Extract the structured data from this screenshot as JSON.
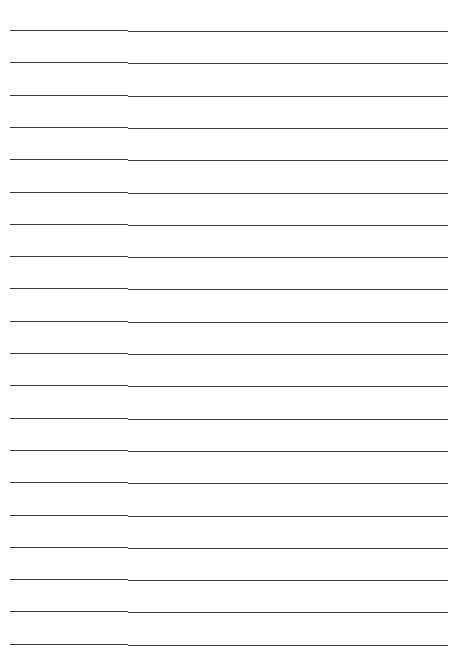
{
  "document": {
    "type": "lined-paper",
    "line_count": 20,
    "line_color": "#3a3a3a",
    "background_color": "#ffffff",
    "first_line_y": 30,
    "line_spacing": 32.3
  }
}
